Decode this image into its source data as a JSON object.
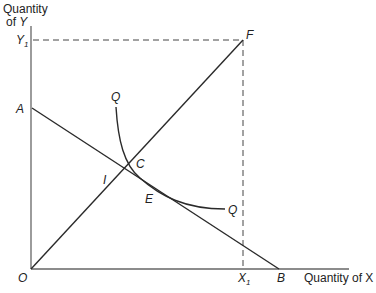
{
  "diagram": {
    "axes": {
      "y_label_line1": "Quantity",
      "y_label_line2": "of ",
      "y_label_var": "Y",
      "x_label": "Quantity of X"
    },
    "points": {
      "origin": "O",
      "A": "A",
      "B": "B",
      "C": "C",
      "E": "E",
      "F": "F",
      "I": "I",
      "Q_top": "Q",
      "Q_end": "Q",
      "X1_main": "X",
      "X1_sub": "1",
      "Y1_main": "Y",
      "Y1_sub": "1"
    },
    "colors": {
      "line": "#2a2a2a",
      "axis": "#555555",
      "dashed": "#444444"
    }
  }
}
